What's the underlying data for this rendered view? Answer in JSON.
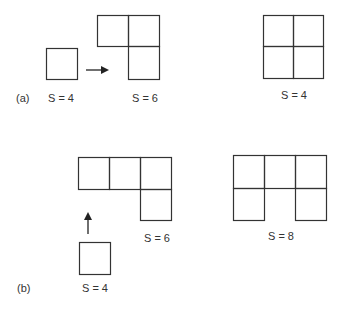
{
  "panels": {
    "a": {
      "tag": "(a)",
      "captions": [
        "S = 4",
        "S = 6",
        "S = 4"
      ]
    },
    "b": {
      "tag": "(b)",
      "captions": [
        "S = 4",
        "S = 6",
        "S = 8"
      ]
    }
  },
  "colors": {
    "stroke": "#333333",
    "background": "#ffffff"
  }
}
